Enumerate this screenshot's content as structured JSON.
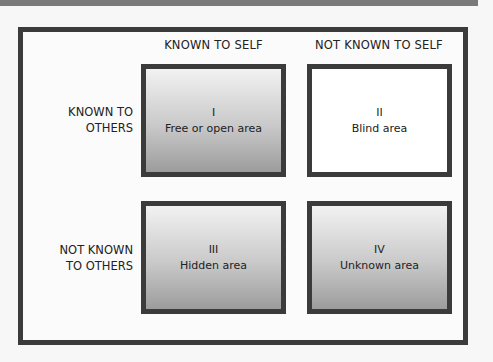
{
  "diagram": {
    "columns": [
      "KNOWN TO SELF",
      "NOT KNOWN TO SELF"
    ],
    "rows": [
      {
        "line1": "KNOWN TO",
        "line2": "OTHERS"
      },
      {
        "line1": "NOT KNOWN",
        "line2": "TO OTHERS"
      }
    ],
    "quadrants": [
      {
        "numeral": "I",
        "label": "Free or open area",
        "fill": "gradient"
      },
      {
        "numeral": "II",
        "label": "Blind area",
        "fill": "#ffffff"
      },
      {
        "numeral": "III",
        "label": "Hidden area",
        "fill": "gradient"
      },
      {
        "numeral": "IV",
        "label": "Unknown area",
        "fill": "gradient"
      }
    ],
    "colors": {
      "border": "#3b3b3b",
      "background": "#fbfbfb",
      "gradient_top": "#f2f2f2",
      "gradient_bottom": "#9c9c9c"
    }
  }
}
